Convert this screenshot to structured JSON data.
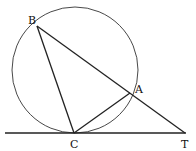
{
  "diagram": {
    "type": "geometry",
    "points": {
      "B": {
        "label": "B",
        "x": 37,
        "y": 26
      },
      "A": {
        "label": "A",
        "x": 130,
        "y": 93
      },
      "C": {
        "label": "C",
        "x": 74,
        "y": 133
      },
      "T": {
        "label": "T",
        "x": 185,
        "y": 133
      }
    },
    "circle": {
      "cx": 75,
      "cy": 70,
      "r": 63
    },
    "segments": [
      "BC",
      "BT",
      "CA",
      "tangent line through C and T"
    ],
    "colors": {
      "stroke": "#222222",
      "background": "#ffffff"
    }
  }
}
